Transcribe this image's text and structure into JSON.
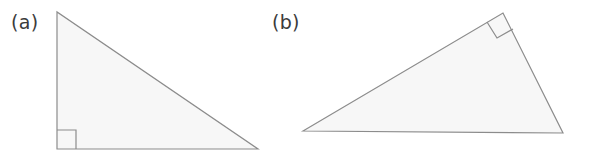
{
  "figure": {
    "background_color": "#ffffff",
    "stroke_color": "#8c8c8c",
    "fill_color": "#f7f7f7",
    "label_color": "#3b3b3b",
    "stroke_width": 1.2,
    "width": 593,
    "height": 164
  },
  "panels": [
    {
      "id": "a",
      "label": "(a)",
      "label_position": {
        "x": 11,
        "y": 13
      },
      "shape": "right-triangle",
      "orientation": "right angle at bottom-left",
      "vertices": [
        {
          "name": "apex",
          "x": 57,
          "y": 12
        },
        {
          "name": "bottom-left",
          "x": 57,
          "y": 149
        },
        {
          "name": "bottom-right",
          "x": 258,
          "y": 149
        }
      ],
      "right_angle_marker": {
        "vertex": "bottom-left",
        "size": 19,
        "points": "57,130 76,130 76,149"
      }
    },
    {
      "id": "b",
      "label": "(b)",
      "label_position": {
        "x": 272,
        "y": 13
      },
      "shape": "right-triangle",
      "orientation": "right angle at top apex",
      "vertices": [
        {
          "name": "left",
          "x": 303,
          "y": 131
        },
        {
          "name": "apex",
          "x": 503,
          "y": 13
        },
        {
          "name": "bottom-right",
          "x": 563,
          "y": 133
        }
      ],
      "right_angle_marker": {
        "vertex": "apex",
        "size": 19,
        "points": "487,22 497,38 513,29"
      }
    }
  ]
}
